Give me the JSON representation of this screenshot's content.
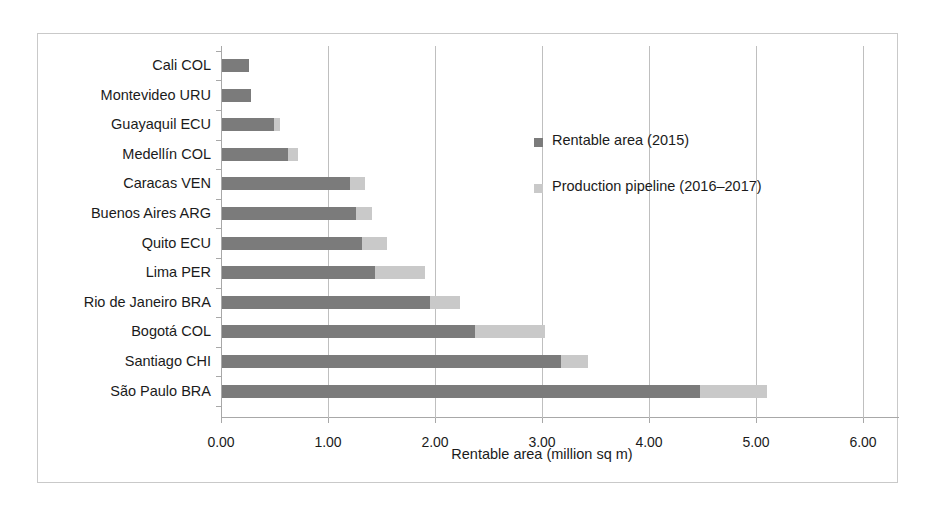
{
  "chart_data": {
    "type": "bar",
    "orientation": "horizontal",
    "stacked": true,
    "title": "",
    "xlabel": "Rentable area (million sq m)",
    "ylabel": "",
    "xlim": [
      0.0,
      6.0
    ],
    "xticks": [
      "0.00",
      "1.00",
      "2.00",
      "3.00",
      "4.00",
      "5.00",
      "6.00"
    ],
    "xtick_values": [
      0.0,
      1.0,
      2.0,
      3.0,
      4.0,
      5.0,
      6.0
    ],
    "grid": "vertical",
    "legend_position": "right-inside",
    "categories": [
      "Cali COL",
      "Montevideo URU",
      "Guayaquil ECU",
      "Medellín COL",
      "Caracas VEN",
      "Buenos Aires ARG",
      "Quito ECU",
      "Lima PER",
      "Rio de Janeiro BRA",
      "Bogotá COL",
      "Santiago CHI",
      "São Paulo BRA"
    ],
    "series": [
      {
        "name": "Rentable area (2015)",
        "color": "#7b7b7b",
        "values": [
          0.25,
          0.27,
          0.49,
          0.62,
          1.2,
          1.25,
          1.31,
          1.43,
          1.94,
          2.36,
          3.17,
          4.47
        ]
      },
      {
        "name": "Production pipeline (2016–2017)",
        "color": "#c9c9c9",
        "values": [
          0.0,
          0.0,
          0.05,
          0.09,
          0.14,
          0.15,
          0.23,
          0.47,
          0.28,
          0.66,
          0.25,
          0.62
        ]
      }
    ]
  },
  "legend": {
    "items": [
      {
        "label": "Rentable area (2015)",
        "color": "#7b7b7b"
      },
      {
        "label": "Production pipeline (2016–2017)",
        "color": "#c9c9c9"
      }
    ]
  }
}
